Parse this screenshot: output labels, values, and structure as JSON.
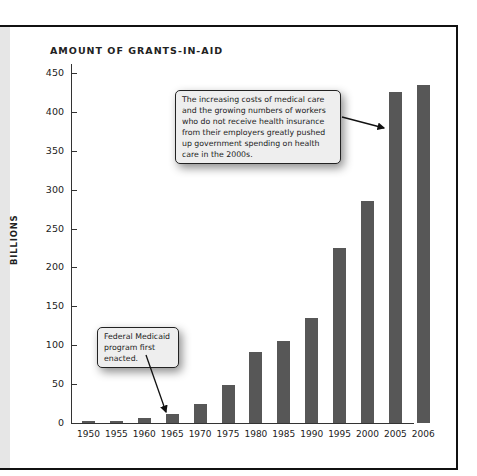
{
  "chart_data": {
    "type": "bar",
    "title": "AMOUNT OF GRANTS-IN-AID",
    "xlabel": "",
    "ylabel": "BILLIONS",
    "categories": [
      "1950",
      "1955",
      "1960",
      "1965",
      "1970",
      "1975",
      "1980",
      "1985",
      "1990",
      "1995",
      "2000",
      "2005",
      "2006"
    ],
    "values": [
      2,
      3,
      7,
      11,
      24,
      49,
      91,
      106,
      135,
      225,
      285,
      426,
      434
    ],
    "ylim": [
      0,
      450
    ],
    "yticks": [
      0,
      50,
      100,
      150,
      200,
      250,
      300,
      350,
      400,
      450
    ],
    "grid": false,
    "legend": null,
    "bar_color": "#575757",
    "annotations": [
      {
        "text": "Federal Medicaid program first enacted.",
        "points_to": "1965"
      },
      {
        "text": "The increasing costs of medical care and the growing numbers of workers who do not receive health insurance from their employers greatly pushed up government spending on health care in the 2000s.",
        "points_to": "2005"
      }
    ]
  },
  "labels": {
    "title": "AMOUNT OF GRANTS-IN-AID",
    "ylabel": "BILLIONS",
    "callout_medicaid": "Federal Medicaid program first enacted.",
    "callout_2000s": "The increasing costs of medical care and the growing numbers of workers who do not receive health insurance from their employers greatly pushed up government spending on health care in the 2000s."
  }
}
